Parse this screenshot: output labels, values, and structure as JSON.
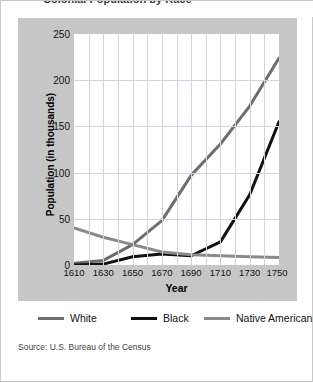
{
  "title": "Colonial Population by Race",
  "source": "Source: U.S. Bureau of the Census",
  "axes": {
    "ylabel": "Population (in thousands)",
    "xlabel": "Year",
    "yticks": [
      "0",
      "50",
      "100",
      "150",
      "200",
      "250"
    ],
    "xticks": [
      "1610",
      "1630",
      "1650",
      "1670",
      "1690",
      "1710",
      "1730",
      "1750"
    ]
  },
  "legend": [
    {
      "label": "White",
      "color": "#6e6e6e"
    },
    {
      "label": "Black",
      "color": "#111111"
    },
    {
      "label": "Native American",
      "color": "#8a8a8a"
    }
  ],
  "chart_data": {
    "type": "line",
    "title": "Colonial Population by Race",
    "xlabel": "Year",
    "ylabel": "Population (in thousands)",
    "x": [
      1610,
      1630,
      1650,
      1670,
      1690,
      1710,
      1730,
      1750
    ],
    "xlim": [
      1610,
      1750
    ],
    "ylim": [
      0,
      250
    ],
    "ytick_step": 50,
    "grid": true,
    "legend_position": "bottom",
    "series": [
      {
        "name": "White",
        "color": "#6e6e6e",
        "values": [
          2,
          5,
          22,
          48,
          97,
          131,
          172,
          224
        ]
      },
      {
        "name": "Black",
        "color": "#111111",
        "values": [
          0,
          1,
          9,
          12,
          10,
          25,
          76,
          155
        ]
      },
      {
        "name": "Native American",
        "color": "#8a8a8a",
        "values": [
          40,
          30,
          22,
          14,
          11,
          10,
          9,
          8
        ]
      }
    ]
  }
}
